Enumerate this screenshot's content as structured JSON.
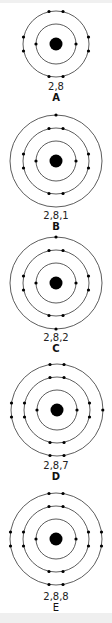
{
  "diagram": {
    "type": "bohr-models",
    "atoms": [
      {
        "id": "A",
        "label": "A",
        "configuration": "2,8",
        "shells": [
          2,
          8
        ]
      },
      {
        "id": "B",
        "label": "B",
        "configuration": "2,8,1",
        "shells": [
          2,
          8,
          1
        ]
      },
      {
        "id": "C",
        "label": "C",
        "configuration": "2,8,2",
        "shells": [
          2,
          8,
          2
        ]
      },
      {
        "id": "D",
        "label": "D",
        "configuration": "2,8,7",
        "shells": [
          2,
          8,
          7
        ]
      },
      {
        "id": "E",
        "label": "E",
        "configuration": "2,8,8",
        "shells": [
          2,
          8,
          8
        ]
      }
    ]
  }
}
